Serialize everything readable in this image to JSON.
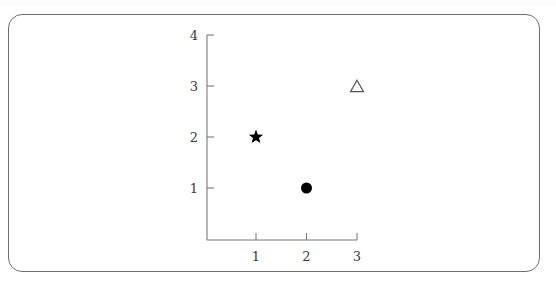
{
  "figure": {
    "background_color": "#ffffff",
    "border_color": "#6f6f6f",
    "axis_color": "#7a7a7a",
    "label_color": "#3a3a3a"
  },
  "chart_data": {
    "type": "scatter",
    "title": "",
    "subtitle": "",
    "xlabel": "",
    "ylabel": "",
    "xlim": [
      0.6,
      3.4
    ],
    "ylim": [
      0.35,
      4.2
    ],
    "grid": false,
    "legend": null,
    "legend_position": "none",
    "xticks": [
      "1",
      "2",
      "3"
    ],
    "xtick_values": [
      1,
      2,
      3
    ],
    "yticks": [
      "1",
      "2",
      "3",
      "4"
    ],
    "ytick_values": [
      1,
      2,
      3,
      4
    ],
    "points": [
      {
        "label": "star-point",
        "x": 1,
        "y": 2,
        "marker": "star",
        "filled": true,
        "color": "#000000",
        "size": 15
      },
      {
        "label": "circle-point",
        "x": 2,
        "y": 1,
        "marker": "circle",
        "filled": true,
        "color": "#000000",
        "size": 11
      },
      {
        "label": "triangle-point",
        "x": 3,
        "y": 3,
        "marker": "triangle",
        "filled": false,
        "color": "#555555",
        "size": 13
      }
    ],
    "annotations": []
  }
}
